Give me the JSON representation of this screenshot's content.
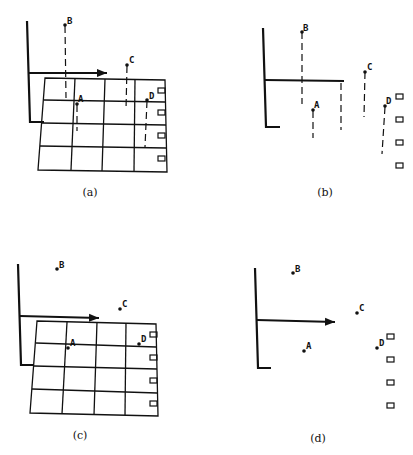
{
  "figure": {
    "panels": [
      {
        "id": "a",
        "label": "(a)",
        "grid": true,
        "drop_lines": true
      },
      {
        "id": "b",
        "label": "(b)",
        "grid": false,
        "drop_lines": true
      },
      {
        "id": "c",
        "label": "(c)",
        "grid": true,
        "drop_lines": false
      },
      {
        "id": "d",
        "label": "(d)",
        "grid": false,
        "drop_lines": false
      }
    ],
    "point_labels": [
      "A",
      "B",
      "C",
      "D"
    ]
  }
}
